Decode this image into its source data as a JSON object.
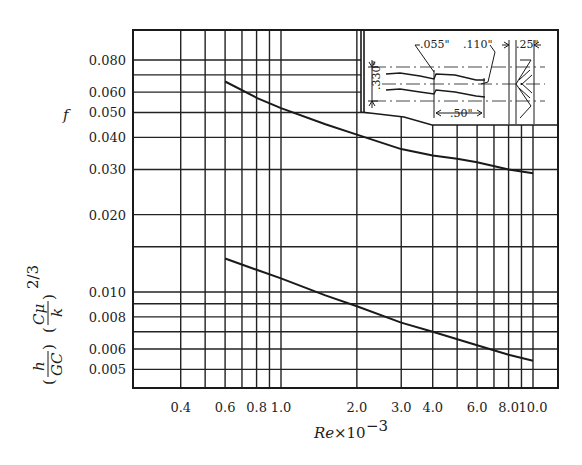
{
  "chart_data": {
    "type": "line",
    "title": "",
    "xlabel": "Re×10⁻³",
    "ylabel_upper": "f",
    "ylabel_lower": "(h/GC)(Cμ/k)^(2/3)",
    "xscale": "log",
    "yscale": "log",
    "xlim": [
      0.3,
      12
    ],
    "ylim": [
      0.0045,
      0.1
    ],
    "grid": true,
    "x_tick_labels": [
      "0.4",
      "0.6",
      "0.8",
      "1.0",
      "2.0",
      "3.0",
      "4.0",
      "6.0",
      "8.0",
      "10.0"
    ],
    "y_tick_labels": [
      "0.080",
      "0.060",
      "0.050",
      "0.040",
      "0.030",
      "0.020",
      "0.010",
      "0.008",
      "0.006",
      "0.005"
    ],
    "series": [
      {
        "name": "f (friction factor)",
        "x": [
          0.6,
          0.8,
          1.0,
          1.5,
          2.0,
          3.0,
          4.0,
          5.0,
          6.0,
          8.0,
          10.0
        ],
        "y": [
          0.066,
          0.057,
          0.052,
          0.045,
          0.041,
          0.036,
          0.034,
          0.033,
          0.032,
          0.03,
          0.029
        ]
      },
      {
        "name": "(h/GC)(Cμ/k)^(2/3) (Colburn j-factor)",
        "x": [
          0.6,
          0.8,
          1.0,
          1.5,
          2.0,
          3.0,
          4.0,
          6.0,
          8.0,
          10.0
        ],
        "y": [
          0.0135,
          0.0122,
          0.0113,
          0.0097,
          0.0088,
          0.0076,
          0.007,
          0.0062,
          0.0057,
          0.0054
        ]
      }
    ],
    "annotations": {
      "inset": "Offset strip-fin geometry",
      "dimensions": [
        ".055\"",
        ".110\"",
        ".25\"",
        ".330\"",
        ".50\""
      ]
    }
  },
  "labels": {
    "xlabel_main": "Re",
    "xlabel_times": "×10",
    "xlabel_exp": "−3",
    "y_upper": "f",
    "y_lower_h": "h",
    "y_lower_gc": "GC",
    "y_lower_cmu": "Cμ",
    "y_lower_k": "k",
    "y_lower_exp": "2/3"
  },
  "dims": {
    "d055": ".055\"",
    "d110": ".110\"",
    "d25": ".25\"",
    "d330": ".330\"",
    "d50": ".50\""
  }
}
